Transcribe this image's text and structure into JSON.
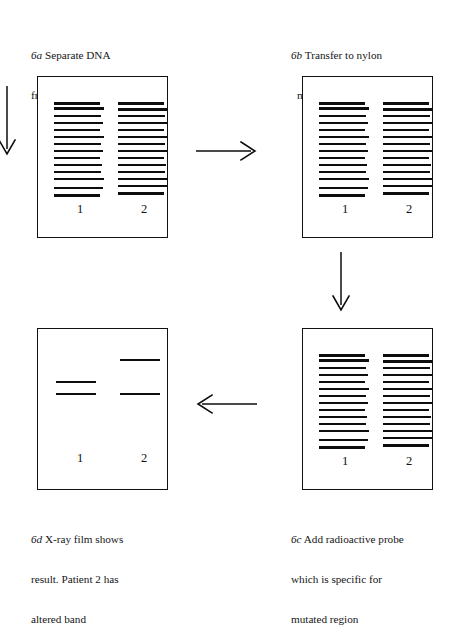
{
  "figure": {
    "ink_color": "#0d0d0d",
    "background_color": "#ffffff"
  },
  "steps": [
    {
      "id": "6a",
      "label": "6a",
      "caption_lines": [
        "Separate DNA",
        "fragments on gel"
      ],
      "panel_type": "gel",
      "lane_labels": [
        "1",
        "2"
      ]
    },
    {
      "id": "6b",
      "label": "6b",
      "caption_lines": [
        "Transfer to nylon",
        "membrane blotting"
      ],
      "panel_type": "gel",
      "lane_labels": [
        "1",
        "2"
      ]
    },
    {
      "id": "6c",
      "label": "6c",
      "caption_lines": [
        "Add radioactive probe",
        "which is specific for",
        "mutated region"
      ],
      "panel_type": "gel",
      "lane_labels": [
        "1",
        "2"
      ]
    },
    {
      "id": "6d",
      "label": "6d",
      "caption_lines": [
        "X-ray film shows",
        "result. Patient 2 has",
        "altered band"
      ],
      "panel_type": "film",
      "lane_labels": [
        "1",
        "2"
      ]
    }
  ],
  "arrows": [
    {
      "name": "entry-arrow",
      "direction": "down",
      "from": "",
      "to": "6a"
    },
    {
      "name": "a-to-b-arrow",
      "direction": "right",
      "from": "6a",
      "to": "6b"
    },
    {
      "name": "b-to-c-arrow",
      "direction": "down",
      "from": "6b",
      "to": "6c"
    },
    {
      "name": "c-to-d-arrow",
      "direction": "left",
      "from": "6c",
      "to": "6d"
    }
  ],
  "chart_data": {
    "type": "table",
    "gel_ladder_1": [
      25,
      30,
      38,
      45,
      52,
      59,
      66,
      73,
      80,
      87,
      94,
      101,
      110,
      117
    ],
    "gel_ladder_2": [
      25,
      31,
      38,
      45,
      52,
      59,
      66,
      73,
      80,
      87,
      94,
      101,
      108,
      115
    ],
    "panels": [
      {
        "step": "6a",
        "lanes": [
          {
            "label": "1",
            "band_count": 14,
            "band_positions": [
              25,
              30,
              38,
              45,
              52,
              59,
              66,
              73,
              80,
              87,
              94,
              101,
              110,
              117
            ]
          },
          {
            "label": "2",
            "band_count": 14,
            "band_positions": [
              25,
              31,
              38,
              45,
              52,
              59,
              66,
              73,
              80,
              87,
              94,
              101,
              108,
              115
            ]
          }
        ]
      },
      {
        "step": "6b",
        "lanes": [
          {
            "label": "1",
            "band_count": 14,
            "band_positions": [
              25,
              30,
              38,
              45,
              52,
              59,
              66,
              73,
              80,
              87,
              94,
              101,
              110,
              117
            ]
          },
          {
            "label": "2",
            "band_count": 14,
            "band_positions": [
              25,
              31,
              38,
              45,
              52,
              59,
              66,
              73,
              80,
              87,
              94,
              101,
              108,
              115
            ]
          }
        ]
      },
      {
        "step": "6c",
        "lanes": [
          {
            "label": "1",
            "band_count": 14,
            "band_positions": [
              25,
              30,
              38,
              45,
              52,
              59,
              66,
              73,
              80,
              87,
              94,
              101,
              110,
              117
            ]
          },
          {
            "label": "2",
            "band_count": 14,
            "band_positions": [
              25,
              31,
              38,
              45,
              52,
              59,
              66,
              73,
              80,
              87,
              94,
              101,
              108,
              115
            ]
          }
        ]
      },
      {
        "step": "6d",
        "lanes": [
          {
            "label": "1",
            "band_count": 2,
            "band_positions": [
              52,
              64
            ],
            "note": "normal pattern"
          },
          {
            "label": "2",
            "band_count": 2,
            "band_positions": [
              30,
              64
            ],
            "note": "upper band shifted higher - altered band"
          }
        ]
      }
    ]
  }
}
